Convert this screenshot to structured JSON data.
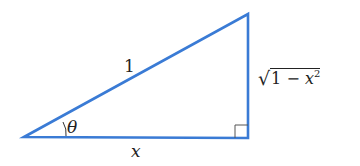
{
  "diagram": {
    "type": "right-triangle",
    "stroke_color": "#3a7bd5",
    "right_angle_marker_color": "#555555",
    "vertices": {
      "left": [
        24,
        137
      ],
      "top_right": [
        248,
        14
      ],
      "bottom_right": [
        248,
        138
      ]
    },
    "labels": {
      "hypotenuse": "1",
      "angle": "θ",
      "adjacent": "x",
      "opposite_radical": "√",
      "opposite_radicand_prefix": "1 − ",
      "opposite_var": "x",
      "opposite_exp": "2"
    }
  }
}
